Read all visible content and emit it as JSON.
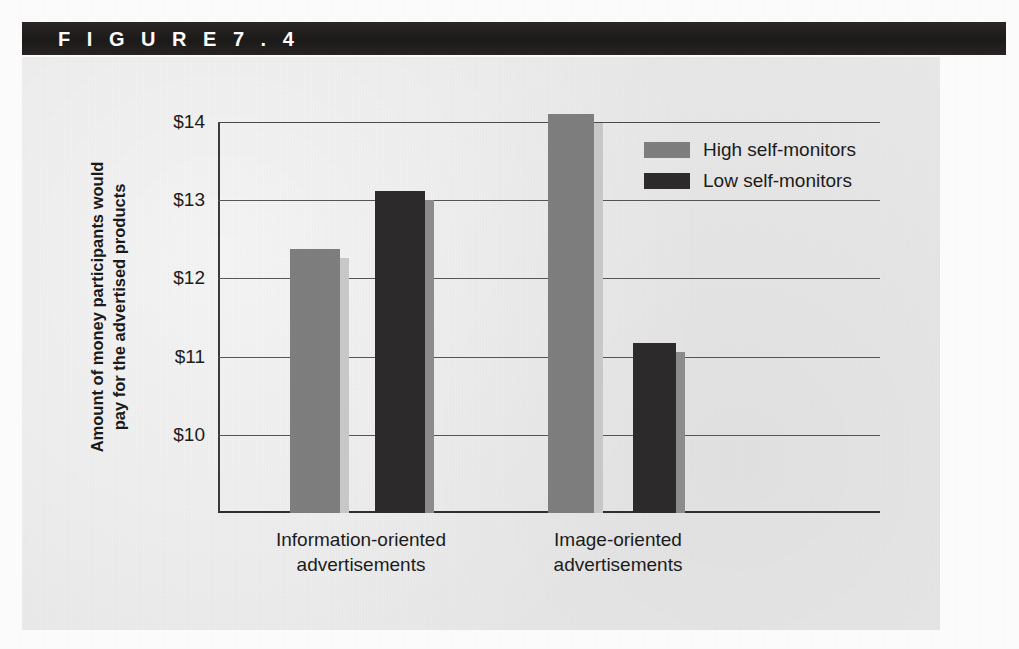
{
  "figure": {
    "header_label": "F I G U R E   7 . 4",
    "header_bg": "#231f1f",
    "panel_bg": "#e9e9e9"
  },
  "chart_data": {
    "type": "bar",
    "title": "",
    "xlabel": "",
    "ylabel": "Amount of money participants would pay for the advertised products",
    "ylabel_line1": "Amount of money participants would",
    "ylabel_line2": "pay for the advertised products",
    "categories": [
      "Information-oriented advertisements",
      "Image-oriented advertisements"
    ],
    "category_lines": [
      [
        "Information-oriented",
        "advertisements"
      ],
      [
        "Image-oriented",
        "advertisements"
      ]
    ],
    "series": [
      {
        "name": "High self-monitors",
        "color": "#807f7f",
        "side_color": "#c9c9c9",
        "values": [
          12.37,
          14.1
        ]
      },
      {
        "name": "Low self-monitors",
        "color": "#2d2b2b",
        "side_color": "#8e8d8d",
        "values": [
          13.12,
          11.17
        ]
      }
    ],
    "ytick_labels": [
      "$14",
      "$13",
      "$12",
      "$11",
      "$10"
    ],
    "ytick_values": [
      14,
      13,
      12,
      11,
      10
    ],
    "ylim": [
      9.0,
      14.0
    ],
    "y_axis_top_value": 14,
    "grid": true,
    "legend_position": "top-right",
    "value_prefix": "$"
  }
}
